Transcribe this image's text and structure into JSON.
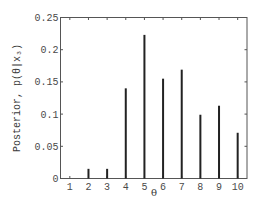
{
  "chart_data": {
    "type": "bar",
    "title": "",
    "xlabel": "θ",
    "ylabel": "Posterior, p(θ|x₃)",
    "categories": [
      "1",
      "2",
      "3",
      "4",
      "5",
      "6",
      "7",
      "8",
      "9",
      "10"
    ],
    "values": [
      0.0,
      0.015,
      0.015,
      0.14,
      0.223,
      0.155,
      0.169,
      0.099,
      0.113,
      0.071
    ],
    "ylim": [
      0,
      0.25
    ],
    "xlim": [
      0.5,
      10.5
    ],
    "yticks": [
      0,
      0.05,
      0.1,
      0.15,
      0.2,
      0.25
    ],
    "ytick_labels": [
      "0",
      "0.05",
      "0.1",
      "0.15",
      "0.2",
      "0.25"
    ],
    "xticks": [
      1,
      2,
      3,
      4,
      5,
      6,
      7,
      8,
      9,
      10
    ],
    "xtick_labels": [
      "1",
      "2",
      "3",
      "4",
      "5",
      "6",
      "7",
      "8",
      "9",
      "10"
    ],
    "grid": false,
    "legend": null,
    "bar_style": "thin vertical stems",
    "bar_color": "#222222",
    "axis_color": "#555555"
  }
}
